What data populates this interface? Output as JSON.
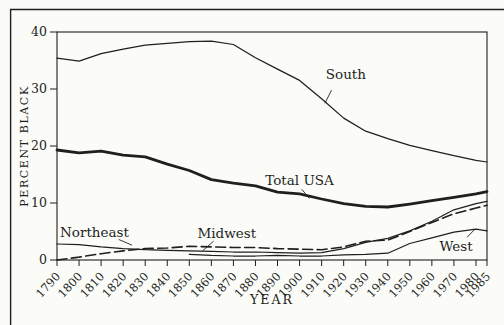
{
  "figure": {
    "background": "#fbfbf8",
    "ink": "#211f1c"
  },
  "chart_data": {
    "type": "line",
    "title": "",
    "xlabel": "YEAR",
    "ylabel": "PERCENT BLACK",
    "xlim": [
      1790,
      1985
    ],
    "ylim": [
      0,
      40
    ],
    "grid": false,
    "legend": "inline-annotations",
    "y_ticks": [
      0,
      10,
      20,
      30,
      40
    ],
    "categories": [
      1790,
      1800,
      1810,
      1820,
      1830,
      1840,
      1850,
      1860,
      1870,
      1880,
      1890,
      1900,
      1910,
      1920,
      1930,
      1940,
      1950,
      1960,
      1970,
      1980,
      1985
    ],
    "series": [
      {
        "name": "South",
        "style": "thin",
        "values": [
          35.4,
          34.9,
          36.2,
          37.0,
          37.7,
          38.0,
          38.3,
          38.4,
          37.8,
          35.5,
          33.5,
          31.5,
          28.3,
          24.9,
          22.6,
          21.3,
          20.1,
          19.2,
          18.3,
          17.5,
          17.2
        ]
      },
      {
        "name": "Total USA",
        "style": "thick",
        "values": [
          19.3,
          18.8,
          19.1,
          18.4,
          18.1,
          16.8,
          15.7,
          14.1,
          13.5,
          13.0,
          11.9,
          11.6,
          10.7,
          9.9,
          9.4,
          9.3,
          9.8,
          10.4,
          11.0,
          11.6,
          12.0
        ]
      },
      {
        "name": "Northeast",
        "style": "thin",
        "values": [
          2.8,
          2.7,
          2.3,
          2.0,
          1.8,
          1.7,
          1.6,
          1.5,
          1.4,
          1.4,
          1.3,
          1.2,
          1.3,
          2.0,
          3.1,
          3.8,
          5.1,
          6.8,
          8.8,
          9.9,
          10.3
        ]
      },
      {
        "name": "Midwest",
        "style": "dashed",
        "values": [
          0.0,
          0.5,
          1.1,
          1.6,
          2.0,
          2.1,
          2.4,
          2.3,
          2.2,
          2.2,
          2.0,
          1.9,
          1.8,
          2.3,
          3.3,
          3.5,
          5.0,
          6.6,
          8.1,
          9.1,
          9.6
        ]
      },
      {
        "name": "West",
        "style": "thin",
        "values": [
          null,
          null,
          null,
          null,
          null,
          null,
          1.0,
          0.8,
          0.7,
          0.7,
          0.8,
          0.7,
          0.7,
          0.9,
          1.0,
          1.2,
          2.9,
          3.9,
          4.9,
          5.4,
          5.1
        ]
      }
    ],
    "annotations": [
      {
        "text": "South",
        "label_year": 1921,
        "label_value": 32.6,
        "pointer": [
          1914.5,
          29.8,
          1911.5,
          27.5
        ]
      },
      {
        "text": "Total USA",
        "label_year": 1900,
        "label_value": 13.9,
        "pointer": [
          1901.0,
          12.4,
          1904.5,
          10.8
        ]
      },
      {
        "text": "Northeast",
        "label_year": 1807,
        "label_value": 4.9,
        "pointer": [
          1818.0,
          3.6,
          1824.0,
          2.6
        ]
      },
      {
        "text": "Midwest",
        "label_year": 1867,
        "label_value": 4.7,
        "pointer": [
          1861.0,
          3.3,
          1856.0,
          1.6
        ]
      },
      {
        "text": "West",
        "label_year": 1971,
        "label_value": 2.4,
        "pointer": [
          1976.0,
          4.0,
          1979.5,
          5.4
        ]
      }
    ]
  }
}
